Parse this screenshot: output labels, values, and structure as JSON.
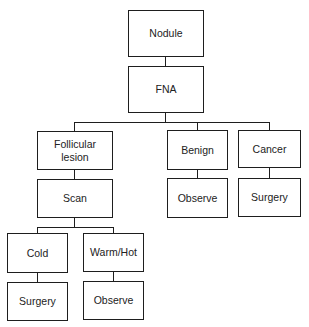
{
  "diagram": {
    "type": "flowchart",
    "nodes": {
      "nodule": {
        "label": "Nodule"
      },
      "fna": {
        "label": "FNA"
      },
      "follicular_lesion": {
        "label": "Follicular\nlesion"
      },
      "benign": {
        "label": "Benign"
      },
      "cancer": {
        "label": "Cancer"
      },
      "scan": {
        "label": "Scan"
      },
      "benign_observe": {
        "label": "Observe"
      },
      "cancer_surgery": {
        "label": "Surgery"
      },
      "cold": {
        "label": "Cold"
      },
      "warm_hot": {
        "label": "Warm/Hot"
      },
      "cold_surgery": {
        "label": "Surgery"
      },
      "warm_observe": {
        "label": "Observe"
      }
    },
    "edges": [
      [
        "Nodule",
        "FNA"
      ],
      [
        "FNA",
        "Follicular lesion"
      ],
      [
        "FNA",
        "Benign"
      ],
      [
        "FNA",
        "Cancer"
      ],
      [
        "Follicular lesion",
        "Scan"
      ],
      [
        "Benign",
        "Observe"
      ],
      [
        "Cancer",
        "Surgery"
      ],
      [
        "Scan",
        "Cold"
      ],
      [
        "Scan",
        "Warm/Hot"
      ],
      [
        "Cold",
        "Surgery"
      ],
      [
        "Warm/Hot",
        "Observe"
      ]
    ]
  }
}
